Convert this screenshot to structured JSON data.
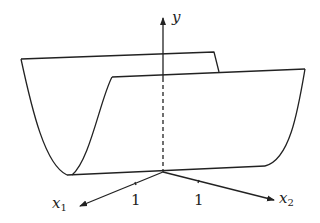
{
  "diagram": {
    "axes": {
      "y": {
        "label": "y"
      },
      "x1": {
        "label": "x",
        "subscript": "1"
      },
      "x2": {
        "label": "x",
        "subscript": "2"
      }
    },
    "tick_labels": {
      "x1_tick": "1",
      "x2_tick": "1"
    },
    "colors": {
      "stroke": "#222222",
      "background": "#ffffff"
    }
  }
}
